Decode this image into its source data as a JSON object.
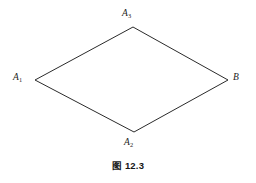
{
  "figure": {
    "caption_prefix": "图",
    "caption_number": "12.3",
    "caption_full": "图 12.3",
    "background_color": "#ffffff",
    "stroke_color": "#2b2b2b",
    "text_color": "#1c1c1c"
  },
  "diagram": {
    "type": "quadrilateral",
    "shape_name": "rhombus",
    "stroke_width": 1,
    "vertices": [
      {
        "id": "A1",
        "label": "A",
        "subscript": "1",
        "x": 35,
        "y": 80,
        "label_x": 13,
        "label_y": 73
      },
      {
        "id": "A3",
        "label": "A",
        "subscript": "3",
        "x": 133,
        "y": 27,
        "label_x": 122,
        "label_y": 9
      },
      {
        "id": "B",
        "label": "B",
        "subscript": "",
        "x": 228,
        "y": 80,
        "label_x": 233,
        "label_y": 73
      },
      {
        "id": "A2",
        "label": "A",
        "subscript": "2",
        "x": 134,
        "y": 132,
        "label_x": 124,
        "label_y": 138
      }
    ],
    "edges": [
      {
        "from": "A1",
        "to": "A3"
      },
      {
        "from": "A3",
        "to": "B"
      },
      {
        "from": "B",
        "to": "A2"
      },
      {
        "from": "A2",
        "to": "A1"
      }
    ],
    "polygon_points": "35,80 133,27 228,80 134,132"
  }
}
